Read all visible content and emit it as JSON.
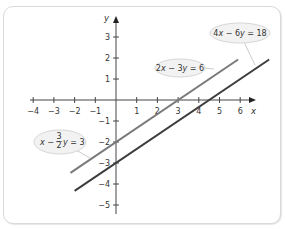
{
  "chart_data": {
    "type": "line",
    "title": "",
    "xlabel": "x",
    "ylabel": "y",
    "xlim": [
      -4,
      6.8
    ],
    "ylim": [
      -5.5,
      3.8
    ],
    "grid": false,
    "x_ticks": [
      -4,
      -3,
      -2,
      -1,
      1,
      2,
      3,
      4,
      5,
      6
    ],
    "y_ticks": [
      3,
      2,
      1,
      -1,
      -2,
      -3,
      -4,
      -5
    ],
    "series": [
      {
        "name": "2x − 3y = 6",
        "equation": "y = (2/3)x − 2",
        "color": "#7a7a7a",
        "x": [
          -2.2,
          5.9
        ],
        "y": [
          -3.47,
          1.93
        ]
      },
      {
        "name": "4x − 6y = 18",
        "equation": "y = (2/3)x − 3",
        "color": "#3d3d3d",
        "x": [
          -2.0,
          7.4
        ],
        "y": [
          -4.33,
          1.93
        ]
      }
    ],
    "annotations": [
      {
        "text": "4x − 6y = 18",
        "points_to": "4x − 6y = 18"
      },
      {
        "text": "2x − 3y = 6",
        "points_to": "2x − 3y = 6"
      },
      {
        "text": "x − (3/2)y = 3",
        "points_to": "2x − 3y = 6"
      }
    ]
  },
  "labels": {
    "x_axis": "x",
    "y_axis": "y",
    "eq1": {
      "a": "4",
      "v1": "x",
      "op": " − 6",
      "v2": "y",
      "rhs": " = 18"
    },
    "eq2": {
      "a": "2",
      "v1": "x",
      "op": " − 3",
      "v2": "y",
      "rhs": " = 6"
    },
    "eq3": {
      "v1": "x",
      "op": " − ",
      "num": "3",
      "den": "2",
      "v2": "y",
      "rhs": " = 3"
    }
  }
}
